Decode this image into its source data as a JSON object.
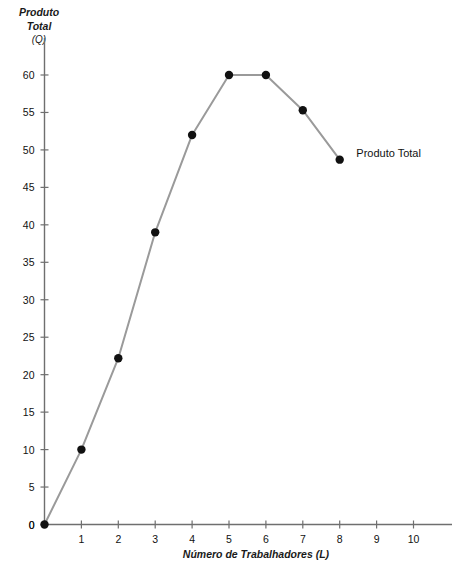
{
  "chart_data": {
    "type": "line",
    "title": "",
    "xlabel": "Número de Trabalhadores (L)",
    "ylabel": "Produto Total (Q)",
    "ylabel_lines": [
      "Produto",
      "Total",
      "(Q)"
    ],
    "xlim": [
      0,
      10.9
    ],
    "ylim": [
      0,
      62
    ],
    "grid": false,
    "legend_position": "inline-right",
    "x": [
      0,
      1,
      2,
      3,
      4,
      5,
      6,
      7,
      8
    ],
    "xticks": [
      0,
      1,
      2,
      3,
      4,
      5,
      6,
      7,
      8,
      9,
      10
    ],
    "xtick_labels": [
      "0",
      "1",
      "2",
      "3",
      "4",
      "5",
      "6",
      "7",
      "8",
      "9",
      "10"
    ],
    "yticks": [
      0,
      5,
      10,
      15,
      20,
      25,
      30,
      35,
      40,
      45,
      50,
      55,
      60
    ],
    "ytick_labels": [
      "0",
      "5",
      "10",
      "15",
      "20",
      "25",
      "30",
      "35",
      "40",
      "45",
      "50",
      "55",
      "60"
    ],
    "series": [
      {
        "name": "Produto Total",
        "values": [
          0,
          10,
          22.2,
          39,
          52,
          60,
          60,
          55.3,
          48.7
        ],
        "line_color": "#9a9a9a",
        "marker_color": "#111111",
        "marker_size": 6
      }
    ],
    "annotations": [
      {
        "text": "Produto Total",
        "x": 8.45,
        "y": 49.5
      }
    ]
  },
  "style": {
    "axis_color": "#6f6f6f",
    "text_color": "#111111",
    "background": "#ffffff"
  }
}
